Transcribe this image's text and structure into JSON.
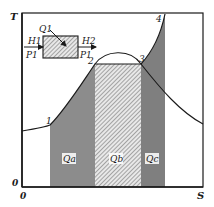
{
  "diagram": {
    "type": "T-S diagram",
    "axes": {
      "y_label": "T",
      "x_label": "S",
      "origin_y_label": "0",
      "origin_x_label": "0"
    },
    "points": [
      {
        "id": "1",
        "label": "1"
      },
      {
        "id": "2",
        "label": "2"
      },
      {
        "id": "3",
        "label": "3"
      },
      {
        "id": "4",
        "label": "4"
      }
    ],
    "regions": {
      "qa": {
        "label": "Qa"
      },
      "qb": {
        "label": "Qb"
      },
      "qc": {
        "label": "Qc"
      }
    },
    "inset": {
      "heat_label": "Q1",
      "inlet_enthalpy": "H1",
      "outlet_enthalpy": "H2",
      "inlet_pressure": "P1",
      "outlet_pressure": "P1"
    },
    "colors": {
      "line": "#1a1a1a",
      "shade_dark": "#8c8c8c",
      "hatch": "#6a6a6a",
      "background": "#ffffff"
    }
  }
}
